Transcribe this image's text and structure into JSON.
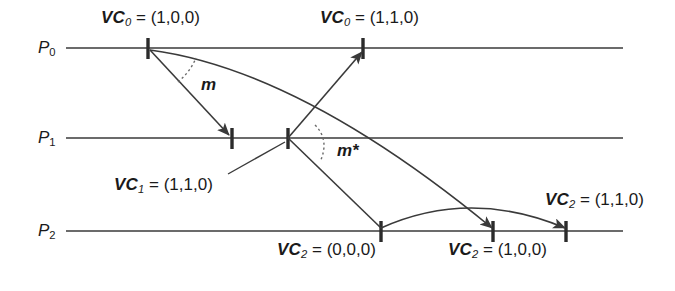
{
  "figure": {
    "type": "vector-clock-timeline-diagram",
    "background_color": "#ffffff",
    "line_color": "#3a3a3a",
    "text_color": "#1a1a1a"
  },
  "processes": [
    {
      "id": "p0",
      "label_name": "P",
      "label_sub": "0",
      "y": 48
    },
    {
      "id": "p1",
      "label_name": "P",
      "label_sub": "1",
      "y": 138
    },
    {
      "id": "p2",
      "label_name": "P",
      "label_sub": "2",
      "y": 231
    }
  ],
  "events": {
    "p0_send": {
      "name": "VC",
      "sub": "0",
      "eq": "=",
      "tuple": "(1,0,0)"
    },
    "p0_recv": {
      "name": "VC",
      "sub": "0",
      "eq": "=",
      "tuple": "(1,1,0)"
    },
    "p1_recv": {
      "name": "VC",
      "sub": "1",
      "eq": "=",
      "tuple": "(1,1,0)"
    },
    "p2_init": {
      "name": "VC",
      "sub": "2",
      "eq": "=",
      "tuple": "(0,0,0)"
    },
    "p2_recv1": {
      "name": "VC",
      "sub": "2",
      "eq": "=",
      "tuple": "(1,0,0)"
    },
    "p2_recv2": {
      "name": "VC",
      "sub": "2",
      "eq": "=",
      "tuple": "(1,1,0)"
    }
  },
  "messages": [
    {
      "id": "m",
      "label": "m"
    },
    {
      "id": "m-star",
      "label": "m*"
    }
  ]
}
